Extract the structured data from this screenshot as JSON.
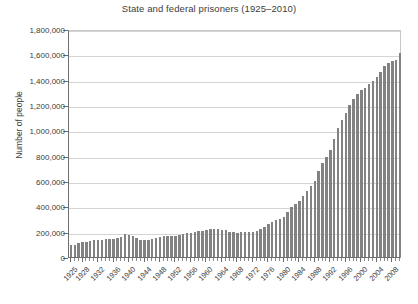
{
  "chart_data": {
    "type": "bar",
    "title": "State and federal prisoners (1925–2010)",
    "xlabel": "",
    "ylabel": "Number of people",
    "ylim": [
      0,
      1800000
    ],
    "ytick_step": 200000,
    "ytick_labels": [
      "0",
      "200,000",
      "400,000",
      "600,000",
      "800,000",
      "1,000,000",
      "1,200,000",
      "1,400,000",
      "1,600,000",
      "1,800,000"
    ],
    "ytick_values": [
      0,
      200000,
      400000,
      600000,
      800000,
      1000000,
      1200000,
      1400000,
      1600000,
      1800000
    ],
    "grid": true,
    "legend": null,
    "bar_color": "#828282",
    "xtick_labels": [
      "1925",
      "1928",
      "1932",
      "1936",
      "1940",
      "1944",
      "1948",
      "1952",
      "1956",
      "1960",
      "1964",
      "1968",
      "1972",
      "1976",
      "1980",
      "1984",
      "1988",
      "1992",
      "1996",
      "2000",
      "2004",
      "2008"
    ],
    "categories": [
      "1925",
      "1926",
      "1927",
      "1928",
      "1929",
      "1930",
      "1931",
      "1932",
      "1933",
      "1934",
      "1935",
      "1936",
      "1937",
      "1938",
      "1939",
      "1940",
      "1941",
      "1942",
      "1943",
      "1944",
      "1945",
      "1946",
      "1947",
      "1948",
      "1949",
      "1950",
      "1951",
      "1952",
      "1953",
      "1954",
      "1955",
      "1956",
      "1957",
      "1958",
      "1959",
      "1960",
      "1961",
      "1962",
      "1963",
      "1964",
      "1965",
      "1966",
      "1967",
      "1968",
      "1969",
      "1970",
      "1971",
      "1972",
      "1973",
      "1974",
      "1975",
      "1976",
      "1977",
      "1978",
      "1979",
      "1980",
      "1981",
      "1982",
      "1983",
      "1984",
      "1985",
      "1986",
      "1987",
      "1988",
      "1989",
      "1990",
      "1991",
      "1992",
      "1993",
      "1994",
      "1995",
      "1996",
      "1997",
      "1998",
      "1999",
      "2000",
      "2001",
      "2002",
      "2003",
      "2004",
      "2005",
      "2006",
      "2007",
      "2008",
      "2009",
      "2010"
    ],
    "values": [
      91669,
      97991,
      109983,
      116390,
      120496,
      129453,
      137082,
      137997,
      136810,
      138316,
      144180,
      145038,
      152741,
      160285,
      179818,
      173706,
      165439,
      150384,
      137220,
      132456,
      133649,
      140079,
      151304,
      155977,
      163749,
      166123,
      165680,
      168233,
      173579,
      182901,
      185780,
      189565,
      195414,
      205643,
      208105,
      212953,
      220149,
      218830,
      217283,
      214336,
      210895,
      199654,
      194896,
      187914,
      196007,
      196429,
      198061,
      196092,
      204211,
      218466,
      240593,
      262833,
      278141,
      294396,
      301470,
      315974,
      353167,
      394374,
      419820,
      443398,
      480568,
      522084,
      560812,
      603732,
      680907,
      739980,
      789610,
      846277,
      932074,
      1016691,
      1085022,
      1138984,
      1197590,
      1245402,
      1287172,
      1316333,
      1330980,
      1367547,
      1390279,
      1421345,
      1462866,
      1504598,
      1532851,
      1547742,
      1555600,
      1612395
    ]
  }
}
